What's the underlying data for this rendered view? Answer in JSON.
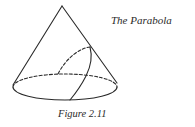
{
  "figure": {
    "title": "The Parabola",
    "caption": "Figure 2.11",
    "stroke_color": "#2a2a2a",
    "background": "#ffffff"
  },
  "cone": {
    "apex": [
      62,
      6
    ],
    "base_ellipse": {
      "cx": 65,
      "cy": 87,
      "rx": 52,
      "ry": 13
    },
    "base_back_half": "dashed",
    "base_front_half": "solid"
  },
  "parabola_section": {
    "vertex_on_generator": [
      90,
      47
    ],
    "hidden_branch": "dashed",
    "visible_branch": "solid"
  }
}
